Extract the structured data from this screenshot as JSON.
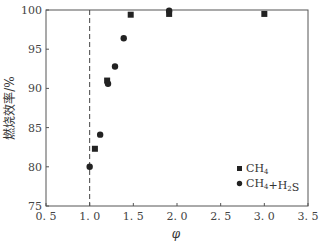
{
  "chart_data": {
    "type": "scatter",
    "title": "",
    "xlabel": "φ",
    "ylabel": "燃烧效率/%",
    "xlim": [
      0.5,
      3.5
    ],
    "ylim": [
      75,
      100
    ],
    "xticks": [
      "0.5",
      "1.0",
      "1.5",
      "2.0",
      "2.5",
      "3.0",
      "3.5"
    ],
    "yticks": [
      "75",
      "80",
      "85",
      "90",
      "95",
      "100"
    ],
    "grid": false,
    "legend_position": "lower right",
    "reference_line": {
      "x": 1.0,
      "style": "dashed"
    },
    "series": [
      {
        "name": "CH4",
        "marker": "square",
        "x": [
          1.06,
          1.2,
          1.47,
          1.91,
          3.0
        ],
        "y": [
          82.3,
          91.0,
          99.4,
          99.5,
          99.5
        ]
      },
      {
        "name": "CH4+H2S",
        "marker": "circle",
        "x": [
          1.0,
          1.12,
          1.21,
          1.29,
          1.39,
          1.91
        ],
        "y": [
          80.0,
          84.1,
          90.6,
          92.8,
          96.4,
          99.9
        ]
      }
    ]
  },
  "legend": {
    "items": [
      {
        "marker": "square",
        "base": "CH",
        "sub": "4",
        "rest": ""
      },
      {
        "marker": "circle",
        "base": "CH",
        "sub": "4",
        "rest": "+H",
        "sub2": "2",
        "rest2": "S"
      }
    ]
  }
}
